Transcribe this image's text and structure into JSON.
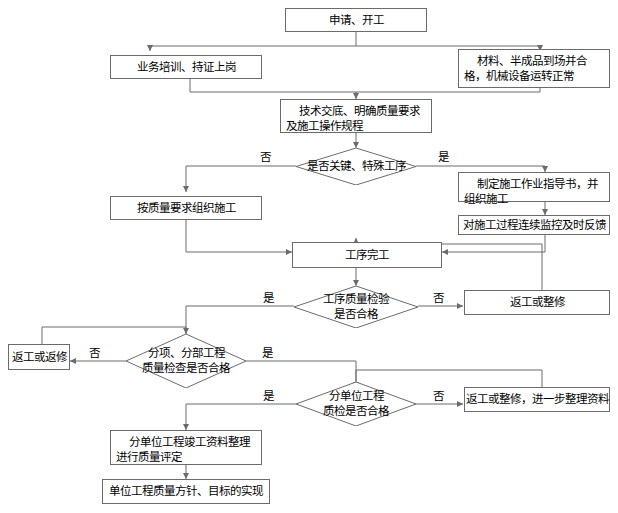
{
  "diagram": {
    "line_color": "#6b6b6b",
    "text_color": "#000000",
    "background": "#ffffff"
  },
  "nodes": {
    "apply_start": "申请、开工",
    "training": "业务培训、持证上岗",
    "materials": "材料、半成品到场并合格，机械设备运转正常",
    "tech_disclosure": "技术交底、明确质量要求及施工操作规程",
    "decision_key_process": "是否关键、特殊工序",
    "org_by_quality": "按质量要求组织施工",
    "work_instruction": "制定施工作业指导书，并组织施工",
    "continuous_monitor": "对施工过程连续监控及时反馈",
    "process_complete": "工序完工",
    "decision_process_quality": "工序质量检验\n是否合格",
    "rework_repair_1": "返工或整修",
    "decision_sub_division": "分项、分部工程\n质量检查是否合格",
    "rework_redo": "返工或返修",
    "decision_sub_unit": "分单位工程\n质检是否合格",
    "rework_repair_2": "返工或整修，进一步整理资料",
    "completion_data": "分单位工程竣工资料整理进行质量评定",
    "final_goal": "单位工程质量方针、目标的实现"
  },
  "edge_labels": {
    "key_no": "否",
    "key_yes": "是",
    "process_quality_yes": "是",
    "process_quality_no": "否",
    "sub_division_no": "否",
    "sub_division_yes": "是",
    "sub_unit_yes": "是",
    "sub_unit_no": "否"
  }
}
